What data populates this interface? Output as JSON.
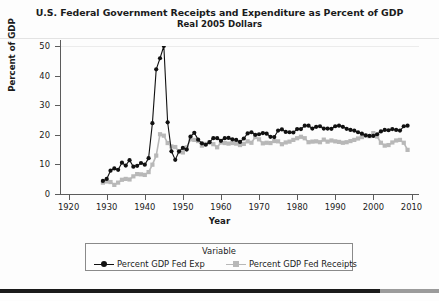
{
  "chart_data": {
    "type": "line",
    "title": "U.S. Federal Government Receipts and Expenditure as Percent of GDP",
    "subtitle": "Real 2005 Dollars",
    "xlabel": "Year",
    "ylabel": "Percent of GDP",
    "xlim": [
      1918,
      2012
    ],
    "ylim": [
      0,
      52
    ],
    "xticks": [
      1920,
      1930,
      1940,
      1950,
      1960,
      1970,
      1980,
      1990,
      2000,
      2010
    ],
    "yticks": [
      0,
      10,
      20,
      30,
      40,
      50
    ],
    "grid": "top-only",
    "legend_position": "bottom",
    "legend_title": "Variable",
    "x": [
      1929,
      1930,
      1931,
      1932,
      1933,
      1934,
      1935,
      1936,
      1937,
      1938,
      1939,
      1940,
      1941,
      1942,
      1943,
      1944,
      1945,
      1946,
      1947,
      1948,
      1949,
      1950,
      1951,
      1952,
      1953,
      1954,
      1955,
      1956,
      1957,
      1958,
      1959,
      1960,
      1961,
      1962,
      1963,
      1964,
      1965,
      1966,
      1967,
      1968,
      1969,
      1970,
      1971,
      1972,
      1973,
      1974,
      1975,
      1976,
      1977,
      1978,
      1979,
      1980,
      1981,
      1982,
      1983,
      1984,
      1985,
      1986,
      1987,
      1988,
      1989,
      1990,
      1991,
      1992,
      1993,
      1994,
      1995,
      1996,
      1997,
      1998,
      1999,
      2000,
      2001,
      2002,
      2003,
      2004,
      2005,
      2006,
      2007,
      2008,
      2009
    ],
    "series": [
      {
        "name": "Percent GDP Fed Exp",
        "color": "#111111",
        "marker": "circle",
        "values": [
          4.6,
          5.3,
          8.2,
          9.0,
          8.5,
          11.0,
          10.0,
          11.9,
          9.6,
          9.9,
          10.9,
          10.3,
          12.6,
          24.9,
          43.8,
          47.7,
          52.0,
          25.2,
          15.0,
          12.0,
          15.0,
          16.2,
          15.6,
          20.2,
          21.5,
          19.1,
          17.8,
          17.3,
          18.2,
          19.6,
          19.6,
          18.7,
          19.6,
          19.7,
          19.2,
          19.0,
          18.3,
          19.5,
          21.3,
          21.7,
          20.8,
          21.0,
          21.4,
          21.2,
          20.1,
          20.0,
          22.3,
          22.7,
          21.8,
          21.7,
          21.6,
          22.8,
          22.8,
          24.0,
          24.0,
          23.0,
          23.6,
          23.8,
          23.0,
          23.0,
          22.9,
          23.8,
          24.0,
          23.6,
          22.9,
          22.5,
          22.3,
          21.7,
          21.2,
          20.6,
          20.4,
          20.4,
          21.0,
          22.0,
          22.5,
          22.4,
          22.8,
          22.5,
          22.3,
          23.8,
          24.0
        ]
      },
      {
        "name": "Percent GDP Fed Receipts",
        "color": "#b8b8b8",
        "marker": "square",
        "values": [
          4.0,
          4.4,
          4.2,
          3.2,
          4.0,
          5.0,
          5.3,
          5.1,
          6.2,
          7.0,
          6.9,
          6.7,
          7.7,
          10.3,
          13.5,
          21.0,
          20.5,
          17.9,
          16.7,
          16.5,
          14.8,
          14.6,
          16.4,
          19.2,
          19.0,
          18.6,
          17.0,
          17.6,
          18.1,
          17.5,
          16.4,
          18.1,
          17.9,
          17.7,
          17.9,
          17.7,
          17.2,
          17.6,
          18.5,
          18.0,
          20.0,
          19.2,
          17.8,
          18.0,
          17.9,
          18.6,
          18.5,
          17.5,
          18.1,
          18.4,
          19.0,
          19.6,
          20.1,
          19.6,
          18.2,
          18.4,
          18.5,
          18.2,
          19.1,
          18.4,
          18.8,
          18.5,
          18.3,
          18.0,
          18.2,
          18.6,
          19.0,
          19.5,
          20.0,
          20.5,
          20.3,
          21.4,
          20.2,
          18.0,
          17.0,
          17.2,
          18.1,
          18.8,
          19.0,
          18.0,
          15.5
        ]
      }
    ]
  },
  "chart": {
    "title": "U.S. Federal Government Receipts and Expenditure as Percent of GDP",
    "subtitle": "Real 2005 Dollars",
    "xlabel": "Year",
    "ylabel": "Percent of GDP"
  },
  "axes": {
    "y_labels": [
      "50",
      "40",
      "30",
      "20",
      "10",
      "0"
    ],
    "x_labels": [
      "1920",
      "1930",
      "1940",
      "1950",
      "1960",
      "1970",
      "1980",
      "1990",
      "2000",
      "2010"
    ]
  },
  "legend": {
    "title": "Variable",
    "items": [
      {
        "label": "Percent GDP Fed Exp",
        "color": "#111111",
        "marker": "circle"
      },
      {
        "label": "Percent GDP Fed Receipts",
        "color": "#b8b8b8",
        "marker": "square"
      }
    ]
  }
}
